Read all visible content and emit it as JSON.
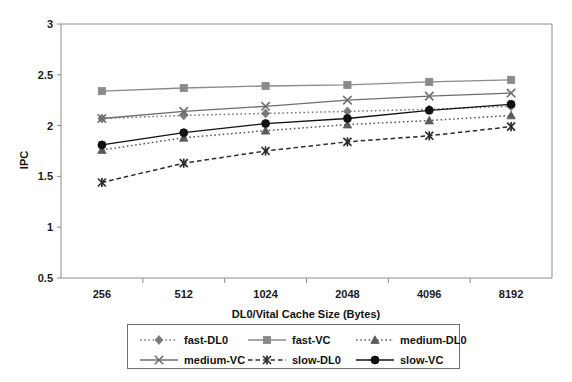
{
  "chart_data": {
    "type": "line",
    "title": "",
    "xlabel": "DL0/Vital Cache Size (Bytes)",
    "ylabel": "IPC",
    "categories": [
      "256",
      "512",
      "1024",
      "2048",
      "4096",
      "8192"
    ],
    "ylim": [
      0.5,
      3
    ],
    "ytick_labels": [
      "0.5",
      "1",
      "1.5",
      "2",
      "2.5",
      "3"
    ],
    "ytick_values": [
      0.5,
      1,
      1.5,
      2,
      2.5,
      3
    ],
    "grid": false,
    "legend_position": "bottom",
    "series": [
      {
        "name": "fast-DL0",
        "marker": "diamond",
        "line_style": "dotted",
        "color": "#7a7a7a",
        "values": [
          2.07,
          2.1,
          2.12,
          2.14,
          2.16,
          2.19
        ]
      },
      {
        "name": "fast-VC",
        "marker": "square",
        "line_style": "solid",
        "color": "#8a8a8a",
        "values": [
          2.34,
          2.37,
          2.39,
          2.4,
          2.43,
          2.45
        ]
      },
      {
        "name": "medium-DL0",
        "marker": "triangle",
        "line_style": "dotted",
        "color": "#5a5a5a",
        "values": [
          1.76,
          1.88,
          1.95,
          2.01,
          2.05,
          2.1
        ]
      },
      {
        "name": "medium-VC",
        "marker": "cross",
        "line_style": "solid",
        "color": "#6e6e6e",
        "values": [
          2.07,
          2.14,
          2.19,
          2.25,
          2.29,
          2.32
        ]
      },
      {
        "name": "slow-DL0",
        "marker": "star-cross",
        "line_style": "dashed",
        "color": "#2b2b2b",
        "values": [
          1.44,
          1.63,
          1.75,
          1.84,
          1.9,
          1.99
        ]
      },
      {
        "name": "slow-VC",
        "marker": "circle",
        "line_style": "solid",
        "color": "#111111",
        "values": [
          1.81,
          1.93,
          2.02,
          2.07,
          2.15,
          2.21
        ]
      }
    ]
  },
  "axes": {
    "y_title": "IPC",
    "x_title": "DL0/Vital Cache Size (Bytes)"
  },
  "legend": {
    "entries": [
      {
        "label": "fast-DL0"
      },
      {
        "label": "fast-VC"
      },
      {
        "label": "medium-DL0"
      },
      {
        "label": "medium-VC"
      },
      {
        "label": "slow-DL0"
      },
      {
        "label": "slow-VC"
      }
    ]
  }
}
